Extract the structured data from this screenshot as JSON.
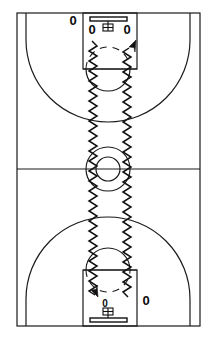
{
  "diagram": {
    "sport": "basketball",
    "view": "full-court-vertical",
    "colors": {
      "court_line": "#1a1a1a",
      "dribble_line": "#111111",
      "background": "#ffffff",
      "marker": "#0b0b0b"
    }
  },
  "court": {
    "boundary": {
      "name": "sideline-baseline-boundary",
      "x": 17,
      "y": 13,
      "width": 183,
      "height": 313
    },
    "half_court_line": {
      "y": 169
    },
    "center_circle_outer": {
      "cx": 108,
      "cy": 169,
      "r": 22
    },
    "center_circle_inner": {
      "cx": 108,
      "cy": 169,
      "r": 12
    }
  },
  "hoops": [
    {
      "id": "top-hoop",
      "position": "top",
      "backboard": {
        "x": 90,
        "y": 17,
        "width": 37,
        "height": 4
      },
      "rim": {
        "cx": 108,
        "cy": 26,
        "r": 4
      },
      "lane": {
        "x": 83,
        "y": 13,
        "width": 54,
        "height": 56
      },
      "free_throw_line_y": 69,
      "free_throw_circle": {
        "cx": 108,
        "cy": 69,
        "r": 22
      },
      "three_point_arc_radius": 82
    },
    {
      "id": "bottom-hoop",
      "position": "bottom",
      "backboard": {
        "x": 90,
        "y": 318,
        "width": 37,
        "height": 4
      },
      "rim": {
        "cx": 108,
        "cy": 312,
        "r": 4
      },
      "lane": {
        "x": 83,
        "y": 270,
        "width": 54,
        "height": 56
      },
      "free_throw_line_y": 270,
      "free_throw_circle": {
        "cx": 108,
        "cy": 270,
        "r": 22
      },
      "three_point_arc_radius": 82
    }
  ],
  "players": [
    {
      "id": "p1",
      "label": "0",
      "x": 73,
      "y": 22,
      "size": "large",
      "zone": "top-left-wing"
    },
    {
      "id": "p2",
      "label": "0",
      "x": 92,
      "y": 31,
      "size": "large",
      "zone": "top-lane-left"
    },
    {
      "id": "p3",
      "label": "0",
      "x": 127,
      "y": 31,
      "size": "large",
      "zone": "top-lane-right"
    },
    {
      "id": "p4",
      "label": "0",
      "x": 105,
      "y": 304,
      "size": "small",
      "zone": "bottom-lane-left"
    },
    {
      "id": "p5",
      "label": "0",
      "x": 146,
      "y": 302,
      "size": "large",
      "zone": "bottom-right-wing"
    }
  ],
  "dribble_paths": [
    {
      "id": "left-dribble-path",
      "style": "zigzag",
      "meaning": "dribble",
      "from": "top-lane-left",
      "to": "bottom-lane-left",
      "direction": "downward",
      "arrow_at": "bottom"
    },
    {
      "id": "right-dribble-path",
      "style": "zigzag",
      "meaning": "dribble",
      "from": "bottom-lane-right",
      "to": "top-lane-right",
      "direction": "upward",
      "arrow_at": "top"
    }
  ],
  "legend": {
    "zigzag_meaning": "dribble",
    "zero_meaning": "player / offensive position"
  }
}
